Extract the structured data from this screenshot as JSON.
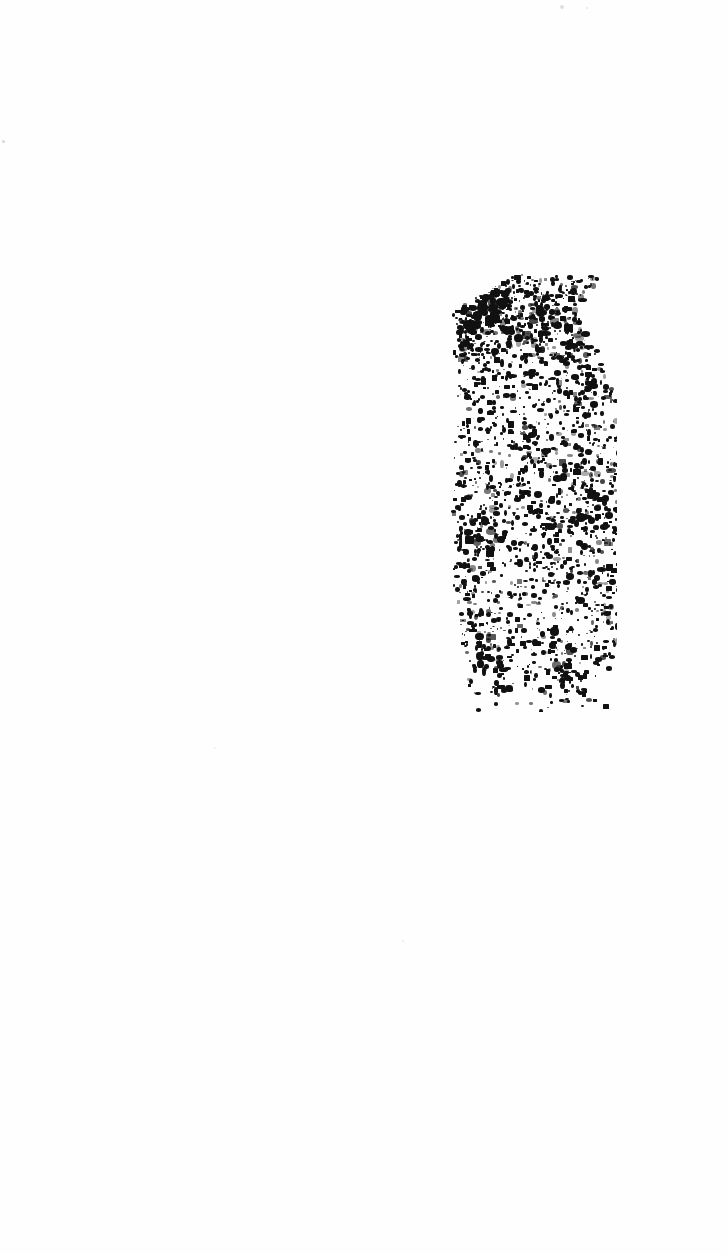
{
  "document": {
    "kind": "scanned-page",
    "condition": "severely degraded / faded",
    "legible_text": "",
    "page_width": 727,
    "page_height": 1254,
    "background_color": "#fefefe",
    "ink_color": "#111111"
  },
  "ink_region": {
    "label": "degraded ink blob",
    "x": 443,
    "y": 274,
    "width": 174,
    "height": 438,
    "speck_count": 2200,
    "seed": 20240917,
    "min_speck_px": 1,
    "max_speck_px": 5,
    "density_profile": [
      {
        "t": 0.0,
        "density": 0.55,
        "left_bias": 0.4,
        "width_frac": 0.62
      },
      {
        "t": 0.08,
        "density": 1.0,
        "left_bias": 0.05,
        "width_frac": 0.72
      },
      {
        "t": 0.18,
        "density": 0.82,
        "left_bias": 0.06,
        "width_frac": 0.86
      },
      {
        "t": 0.3,
        "density": 0.58,
        "left_bias": 0.08,
        "width_frac": 0.95
      },
      {
        "t": 0.45,
        "density": 0.7,
        "left_bias": 0.04,
        "width_frac": 1.0
      },
      {
        "t": 0.6,
        "density": 0.74,
        "left_bias": 0.05,
        "width_frac": 1.0
      },
      {
        "t": 0.72,
        "density": 0.62,
        "left_bias": 0.06,
        "width_frac": 0.98
      },
      {
        "t": 0.85,
        "density": 0.52,
        "left_bias": 0.1,
        "width_frac": 0.94
      },
      {
        "t": 0.94,
        "density": 0.34,
        "left_bias": 0.14,
        "width_frac": 0.88
      },
      {
        "t": 1.0,
        "density": 0.1,
        "left_bias": 0.18,
        "width_frac": 0.8
      }
    ],
    "clusters": [
      {
        "cx": 0.14,
        "cy": 0.06,
        "r": 0.1,
        "weight": 1.0,
        "size_boost": 1.9
      },
      {
        "cx": 0.3,
        "cy": 0.05,
        "r": 0.09,
        "weight": 0.8,
        "size_boost": 1.6
      },
      {
        "cx": 0.1,
        "cy": 0.14,
        "r": 0.07,
        "weight": 0.7,
        "size_boost": 1.4
      },
      {
        "cx": 0.55,
        "cy": 0.12,
        "r": 0.09,
        "weight": 0.5,
        "size_boost": 1.2
      },
      {
        "cx": 0.8,
        "cy": 0.3,
        "r": 0.08,
        "weight": 0.55,
        "size_boost": 1.2
      },
      {
        "cx": 0.86,
        "cy": 0.52,
        "r": 0.09,
        "weight": 0.75,
        "size_boost": 1.5
      },
      {
        "cx": 0.62,
        "cy": 0.6,
        "r": 0.08,
        "weight": 0.55,
        "size_boost": 1.2
      },
      {
        "cx": 0.2,
        "cy": 0.58,
        "r": 0.08,
        "weight": 0.5,
        "size_boost": 1.2
      },
      {
        "cx": 0.22,
        "cy": 0.82,
        "r": 0.09,
        "weight": 0.6,
        "size_boost": 1.3
      },
      {
        "cx": 0.7,
        "cy": 0.9,
        "r": 0.08,
        "weight": 0.55,
        "size_boost": 1.3
      },
      {
        "cx": 0.45,
        "cy": 0.45,
        "r": 0.07,
        "weight": 0.35,
        "size_boost": 1.0
      }
    ]
  },
  "stray_specks": [
    {
      "x": 2,
      "y": 140,
      "size": 3,
      "color": "#d8d8d8"
    },
    {
      "x": 560,
      "y": 5,
      "size": 4,
      "color": "#e0e0e0"
    },
    {
      "x": 586,
      "y": 7,
      "size": 2,
      "color": "#e6e6e6"
    },
    {
      "x": 402,
      "y": 940,
      "size": 2,
      "color": "#ededed"
    },
    {
      "x": 214,
      "y": 747,
      "size": 2,
      "color": "#efefef"
    }
  ]
}
